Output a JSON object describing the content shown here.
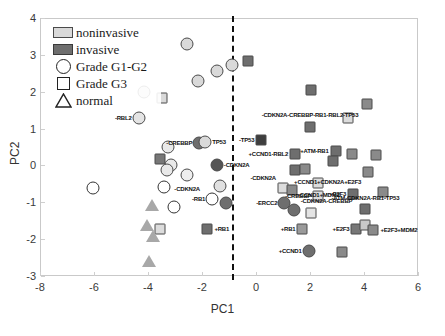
{
  "chart_data": {
    "type": "scatter",
    "title": "",
    "xlabel": "PC1",
    "ylabel": "PC2",
    "xlim": [
      -8,
      6
    ],
    "ylim": [
      -3,
      4
    ],
    "xticks": [
      "-8",
      "-6",
      "-4",
      "-2",
      "0",
      "2",
      "4",
      "6"
    ],
    "yticks": [
      "-3",
      "-2",
      "-1",
      "0",
      "1",
      "2",
      "3",
      "4"
    ],
    "grid": false,
    "legend": {
      "position": "top-left",
      "entries": [
        {
          "label": "noninvasive",
          "glyph": "filled-swatch-light",
          "color": "#d9d9d9"
        },
        {
          "label": "invasive",
          "glyph": "filled-swatch-dark",
          "color": "#6e6e6e"
        },
        {
          "label": "Grade G1-G2",
          "glyph": "circle-outline"
        },
        {
          "label": "Grade G3",
          "glyph": "square-outline"
        },
        {
          "label": "normal",
          "glyph": "triangle-outline"
        }
      ]
    },
    "annotations": [
      {
        "text": "divider",
        "type": "vline",
        "x": -0.9,
        "style": "dashed",
        "color": "#111111"
      }
    ],
    "colors": {
      "noninvasive": "#d9d9d9",
      "invasive": "#6e6e6e",
      "normal": "#a8a8a8",
      "outline": "#222222",
      "axis": "#c9c9c9",
      "text": "#111111"
    },
    "points": [
      {
        "x": -2.55,
        "y": 3.3,
        "shape": "circle",
        "fill": "#d9d9d9",
        "label": ""
      },
      {
        "x": -1.45,
        "y": 2.55,
        "shape": "circle",
        "fill": "#d9d9d9",
        "label": ""
      },
      {
        "x": -2.15,
        "y": 2.3,
        "shape": "circle",
        "fill": "#d9d9d9",
        "label": ""
      },
      {
        "x": -4.15,
        "y": 1.98,
        "shape": "circle",
        "fill": "#d9d9d9",
        "label": ""
      },
      {
        "x": -3.5,
        "y": 1.82,
        "shape": "square",
        "fill": "#d9d9d9",
        "label": ""
      },
      {
        "x": -4.35,
        "y": 1.28,
        "shape": "circle",
        "fill": "#e4e4e4",
        "label": "-RBL2",
        "side": "r"
      },
      {
        "x": -0.9,
        "y": 2.72,
        "shape": "circle",
        "fill": "#d9d9d9",
        "label": ""
      },
      {
        "x": -2.1,
        "y": 0.62,
        "shape": "circle",
        "fill": "#6e6e6e",
        "label": "-CREBBP",
        "side": "r"
      },
      {
        "x": -1.88,
        "y": 0.64,
        "shape": "circle",
        "fill": "#d9d9d9",
        "label": "TP53",
        "side": "l"
      },
      {
        "x": -1.45,
        "y": 0.02,
        "shape": "circle",
        "fill": "#555555",
        "label": "-CDKN2A",
        "side": "l"
      },
      {
        "x": -3.25,
        "y": 0.5,
        "shape": "circle",
        "fill": "#e9e9e9",
        "label": ""
      },
      {
        "x": -3.55,
        "y": 0.18,
        "shape": "square",
        "fill": "#777777",
        "label": ""
      },
      {
        "x": -3.15,
        "y": 0.02,
        "shape": "circle",
        "fill": "#e9e9e9",
        "label": ""
      },
      {
        "x": -3.3,
        "y": -0.12,
        "shape": "circle",
        "fill": "#e9e9e9",
        "label": ""
      },
      {
        "x": -2.55,
        "y": -0.25,
        "shape": "circle",
        "fill": "#eeeeee",
        "label": "-CDKN2A",
        "side": "c",
        "dy": 14
      },
      {
        "x": -3.4,
        "y": -0.58,
        "shape": "circle",
        "fill": "#ffffff",
        "label": ""
      },
      {
        "x": -6.05,
        "y": -0.62,
        "shape": "circle",
        "fill": "#ffffff",
        "label": ""
      },
      {
        "x": -1.35,
        "y": -0.55,
        "shape": "circle",
        "fill": "#e0e0e0",
        "label": ""
      },
      {
        "x": -1.62,
        "y": -0.92,
        "shape": "circle",
        "fill": "#ffffff",
        "label": "-RB1",
        "side": "r"
      },
      {
        "x": -1.1,
        "y": -1.02,
        "shape": "circle",
        "fill": "#6e6e6e",
        "label": ""
      },
      {
        "x": -3.05,
        "y": -1.12,
        "shape": "circle",
        "fill": "#ffffff",
        "label": ""
      },
      {
        "x": -3.85,
        "y": -1.08,
        "shape": "tri",
        "fill": "#a8a8a8",
        "label": ""
      },
      {
        "x": -3.55,
        "y": -1.72,
        "shape": "square",
        "fill": "#dcdcdc",
        "label": ""
      },
      {
        "x": -4.05,
        "y": -1.62,
        "shape": "tri",
        "fill": "#a8a8a8",
        "label": ""
      },
      {
        "x": -3.8,
        "y": -1.92,
        "shape": "tri",
        "fill": "#a8a8a8",
        "label": ""
      },
      {
        "x": -3.95,
        "y": -2.58,
        "shape": "tri",
        "fill": "#a8a8a8",
        "label": ""
      },
      {
        "x": -1.8,
        "y": -1.72,
        "shape": "square",
        "fill": "#6e6e6e",
        "label": "+RB1",
        "side": "l"
      },
      {
        "x": -0.3,
        "y": 2.82,
        "shape": "square",
        "fill": "#6e6e6e",
        "label": ""
      },
      {
        "x": 2.05,
        "y": 2.05,
        "shape": "square",
        "fill": "#6e6e6e",
        "label": ""
      },
      {
        "x": 4.1,
        "y": 1.68,
        "shape": "square",
        "fill": "#8a8a8a",
        "label": ""
      },
      {
        "x": 3.4,
        "y": 1.3,
        "shape": "square",
        "fill": "#dcdcdc",
        "label": ""
      },
      {
        "x": 2.0,
        "y": 1.05,
        "shape": "square",
        "fill": "#6e6e6e",
        "label": "-CDKN2A-CREBBP-RB1-RBL2-TP53",
        "side": "c",
        "dy": -12
      },
      {
        "x": 0.2,
        "y": 0.68,
        "shape": "square",
        "fill": "#3e3e3e",
        "label": "-TP53",
        "side": "r"
      },
      {
        "x": 1.45,
        "y": 0.3,
        "shape": "square",
        "fill": "#6e6e6e",
        "label": "+CCND1-RBL2",
        "side": "r"
      },
      {
        "x": 2.95,
        "y": 0.4,
        "shape": "square",
        "fill": "#6e6e6e",
        "label": "+ATM-RB1",
        "side": "r"
      },
      {
        "x": 3.55,
        "y": 0.32,
        "shape": "square",
        "fill": "#8a8a8a",
        "label": ""
      },
      {
        "x": 4.45,
        "y": 0.28,
        "shape": "square",
        "fill": "#8a8a8a",
        "label": ""
      },
      {
        "x": 1.45,
        "y": -0.12,
        "shape": "square",
        "fill": "#6e6e6e",
        "label": ""
      },
      {
        "x": 1.8,
        "y": -0.1,
        "shape": "square",
        "fill": "#8a8a8a",
        "label": ""
      },
      {
        "x": 2.85,
        "y": 0.12,
        "shape": "square",
        "fill": "#6e6e6e",
        "label": ""
      },
      {
        "x": 4.15,
        "y": -0.18,
        "shape": "square",
        "fill": "#8a8a8a",
        "label": "+CCND1+CDKN2A+E2F3",
        "side": "r",
        "dy": 10
      },
      {
        "x": 2.3,
        "y": -0.48,
        "shape": "square",
        "fill": "#dcdcdc",
        "label": "+CCND1+MDM2",
        "side": "c",
        "dy": 12
      },
      {
        "x": 1.0,
        "y": -0.62,
        "shape": "square",
        "fill": "#dcdcdc",
        "label": "-CDKN2A",
        "side": "r",
        "dy": -10
      },
      {
        "x": 1.35,
        "y": -0.68,
        "shape": "square",
        "fill": "#8a8a8a",
        "label": ""
      },
      {
        "x": 4.7,
        "y": -0.72,
        "shape": "square",
        "fill": "#8a8a8a",
        "label": ""
      },
      {
        "x": 2.3,
        "y": -0.82,
        "shape": "square",
        "fill": "#dcdcdc",
        "label": "-CREBBP",
        "side": "r"
      },
      {
        "x": 3.6,
        "y": -0.78,
        "shape": "square",
        "fill": "#6e6e6e",
        "label": "+E2F3",
        "side": "r"
      },
      {
        "x": 1.05,
        "y": -1.02,
        "shape": "circle",
        "fill": "#6e6e6e",
        "label": "-ERCC2",
        "side": "r"
      },
      {
        "x": 1.4,
        "y": -1.22,
        "shape": "circle",
        "fill": "#6e6e6e",
        "label": "-CDKN2A-CREBBP",
        "side": "l",
        "dy": -9
      },
      {
        "x": 2.05,
        "y": -1.3,
        "shape": "square",
        "fill": "#e4e4e4",
        "label": ""
      },
      {
        "x": 4.05,
        "y": -1.18,
        "shape": "square",
        "fill": "#6e6e6e",
        "label": "-ATM-CDKN2A-RB1-TP53",
        "side": "c",
        "dy": -11
      },
      {
        "x": 1.72,
        "y": -1.72,
        "shape": "square",
        "fill": "#9a9a9a",
        "label": "+RB1",
        "side": "r"
      },
      {
        "x": 3.72,
        "y": -1.72,
        "shape": "square",
        "fill": "#777777",
        "label": "+E2F3",
        "side": "r"
      },
      {
        "x": 4.05,
        "y": -1.62,
        "shape": "square",
        "fill": "#c9c9c9",
        "label": ""
      },
      {
        "x": 4.35,
        "y": -1.75,
        "shape": "square",
        "fill": "#8a8a8a",
        "label": "+E2F3+MDM2",
        "side": "l"
      },
      {
        "x": 1.95,
        "y": -2.32,
        "shape": "circle",
        "fill": "#6e6e6e",
        "label": "+CCND1",
        "side": "r"
      },
      {
        "x": 3.2,
        "y": -2.35,
        "shape": "square",
        "fill": "#8a8a8a",
        "label": ""
      }
    ]
  }
}
